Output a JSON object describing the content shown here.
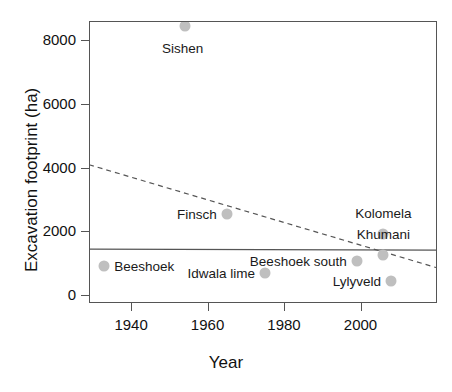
{
  "chart_data": {
    "type": "scatter",
    "title": "",
    "xlabel": "Year",
    "ylabel": "Excavation footprint (ha)",
    "xlim": [
      1929,
      2020
    ],
    "ylim": [
      -250,
      8600
    ],
    "xticks": [
      1940,
      1960,
      1980,
      2000
    ],
    "yticks": [
      0,
      2000,
      4000,
      6000,
      8000
    ],
    "grid": false,
    "legend": "none",
    "point_color": "#bfbfbf",
    "line_color": "#555555",
    "points": [
      {
        "label": "Sishen",
        "x": 1954,
        "y": 8430,
        "label_pos": "below"
      },
      {
        "label": "Finsch",
        "x": 1965,
        "y": 2530,
        "label_pos": "left"
      },
      {
        "label": "Beeshoek",
        "x": 1933,
        "y": 920,
        "label_pos": "right"
      },
      {
        "label": "Idwala lime",
        "x": 1975,
        "y": 700,
        "label_pos": "left"
      },
      {
        "label": "Beeshoek south",
        "x": 1999,
        "y": 1070,
        "label_pos": "left"
      },
      {
        "label": "Kolomela",
        "x": 2006,
        "y": 1920,
        "label_pos": "above"
      },
      {
        "label": "Khumani",
        "x": 2006,
        "y": 1250,
        "label_pos": "above"
      },
      {
        "label": "Lylyveld",
        "x": 2008,
        "y": 430,
        "label_pos": "left"
      }
    ],
    "lines": [
      {
        "name": "trend-dashed",
        "style": "dashed",
        "x": [
          1929,
          2020
        ],
        "y": [
          4090,
          855
        ]
      },
      {
        "name": "mean-solid",
        "style": "solid",
        "x": [
          1929,
          2020
        ],
        "y": [
          1440,
          1410
        ]
      }
    ]
  }
}
